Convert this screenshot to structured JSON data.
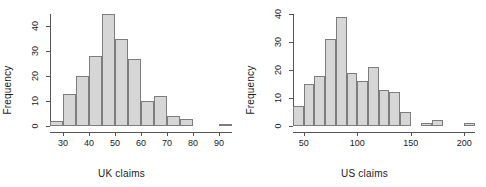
{
  "figure": {
    "kind": "two-panel-histogram",
    "bar_fill": "#d6d6d6",
    "bar_border": "#7d7d7d",
    "axis_color": "#555555",
    "background": "#ffffff"
  },
  "panels": [
    {
      "id": "uk",
      "xlabel": "UK claims",
      "ylabel": "Frequency",
      "ytick_labels": [
        "0",
        "10",
        "20",
        "30",
        "40"
      ],
      "xtick_labels": [
        "30",
        "40",
        "50",
        "60",
        "70",
        "80",
        "90"
      ]
    },
    {
      "id": "us",
      "xlabel": "US claims",
      "ylabel": "Frequency",
      "ytick_labels": [
        "0",
        "10",
        "20",
        "30",
        "40"
      ],
      "xtick_labels": [
        "50",
        "100",
        "150",
        "200"
      ]
    }
  ],
  "chart_data": [
    {
      "type": "bar",
      "id": "uk-histogram",
      "title": "",
      "xlabel": "UK claims",
      "ylabel": "Frequency",
      "xlim": [
        25,
        95
      ],
      "ylim": [
        0,
        45
      ],
      "yticks": [
        0,
        10,
        20,
        30,
        40
      ],
      "xticks": [
        30,
        40,
        50,
        60,
        70,
        80,
        90
      ],
      "grid": false,
      "legend": "none",
      "bin_width": 5,
      "bin_edges": [
        25,
        30,
        35,
        40,
        45,
        50,
        55,
        60,
        65,
        70,
        75,
        80,
        85,
        90,
        95
      ],
      "categories": [
        "25-30",
        "30-35",
        "35-40",
        "40-45",
        "45-50",
        "50-55",
        "55-60",
        "60-65",
        "65-70",
        "70-75",
        "75-80",
        "80-85",
        "85-90",
        "90-95"
      ],
      "values": [
        2,
        13,
        20,
        28,
        45,
        35,
        27,
        10,
        12,
        4,
        3,
        0,
        0,
        1
      ]
    },
    {
      "type": "bar",
      "id": "us-histogram",
      "title": "",
      "xlabel": "US claims",
      "ylabel": "Frequency",
      "xlim": [
        40,
        210
      ],
      "ylim": [
        0,
        40
      ],
      "yticks": [
        0,
        10,
        20,
        30,
        40
      ],
      "xticks": [
        50,
        100,
        150,
        200
      ],
      "grid": false,
      "legend": "none",
      "bin_width": 10,
      "bin_edges": [
        40,
        50,
        60,
        70,
        80,
        90,
        100,
        110,
        120,
        130,
        140,
        150,
        160,
        170,
        180,
        190,
        200,
        210
      ],
      "categories": [
        "40-50",
        "50-60",
        "60-70",
        "70-80",
        "80-90",
        "90-100",
        "100-110",
        "110-120",
        "120-130",
        "130-140",
        "140-150",
        "150-160",
        "160-170",
        "170-180",
        "180-190",
        "190-200",
        "200-210"
      ],
      "values": [
        7,
        15,
        18,
        31,
        39,
        19,
        16,
        21,
        13,
        12,
        5,
        0,
        1,
        2,
        0,
        0,
        1
      ]
    }
  ]
}
